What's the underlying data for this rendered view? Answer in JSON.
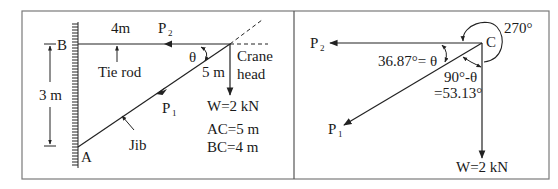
{
  "left_panel": {
    "labels": {
      "B": "B",
      "A": "A",
      "tie_rod_length": "4m",
      "height": "3 m",
      "tie_rod": "Tie rod",
      "jib": "Jib",
      "jib_length": "5 m",
      "crane": "Crane",
      "head": "head",
      "theta": "θ",
      "P2": "P",
      "P2_sub": "2",
      "P1": "P",
      "P1_sub": "1",
      "weight": "W=2 kN",
      "ac": "AC=5 m",
      "bc": "BC=4 m"
    }
  },
  "right_panel": {
    "labels": {
      "C": "C",
      "angle_270": "270°",
      "P2": "P",
      "P2_sub": "2",
      "P1": "P",
      "P1_sub": "1",
      "theta_eq": "36.87°= θ",
      "comp_angle": "90°-θ",
      "comp_value": "=53.13°",
      "weight": "W=2 kN"
    }
  },
  "colors": {
    "line": "#222222",
    "frame": "#7a7a7a",
    "background": "#ffffff"
  }
}
